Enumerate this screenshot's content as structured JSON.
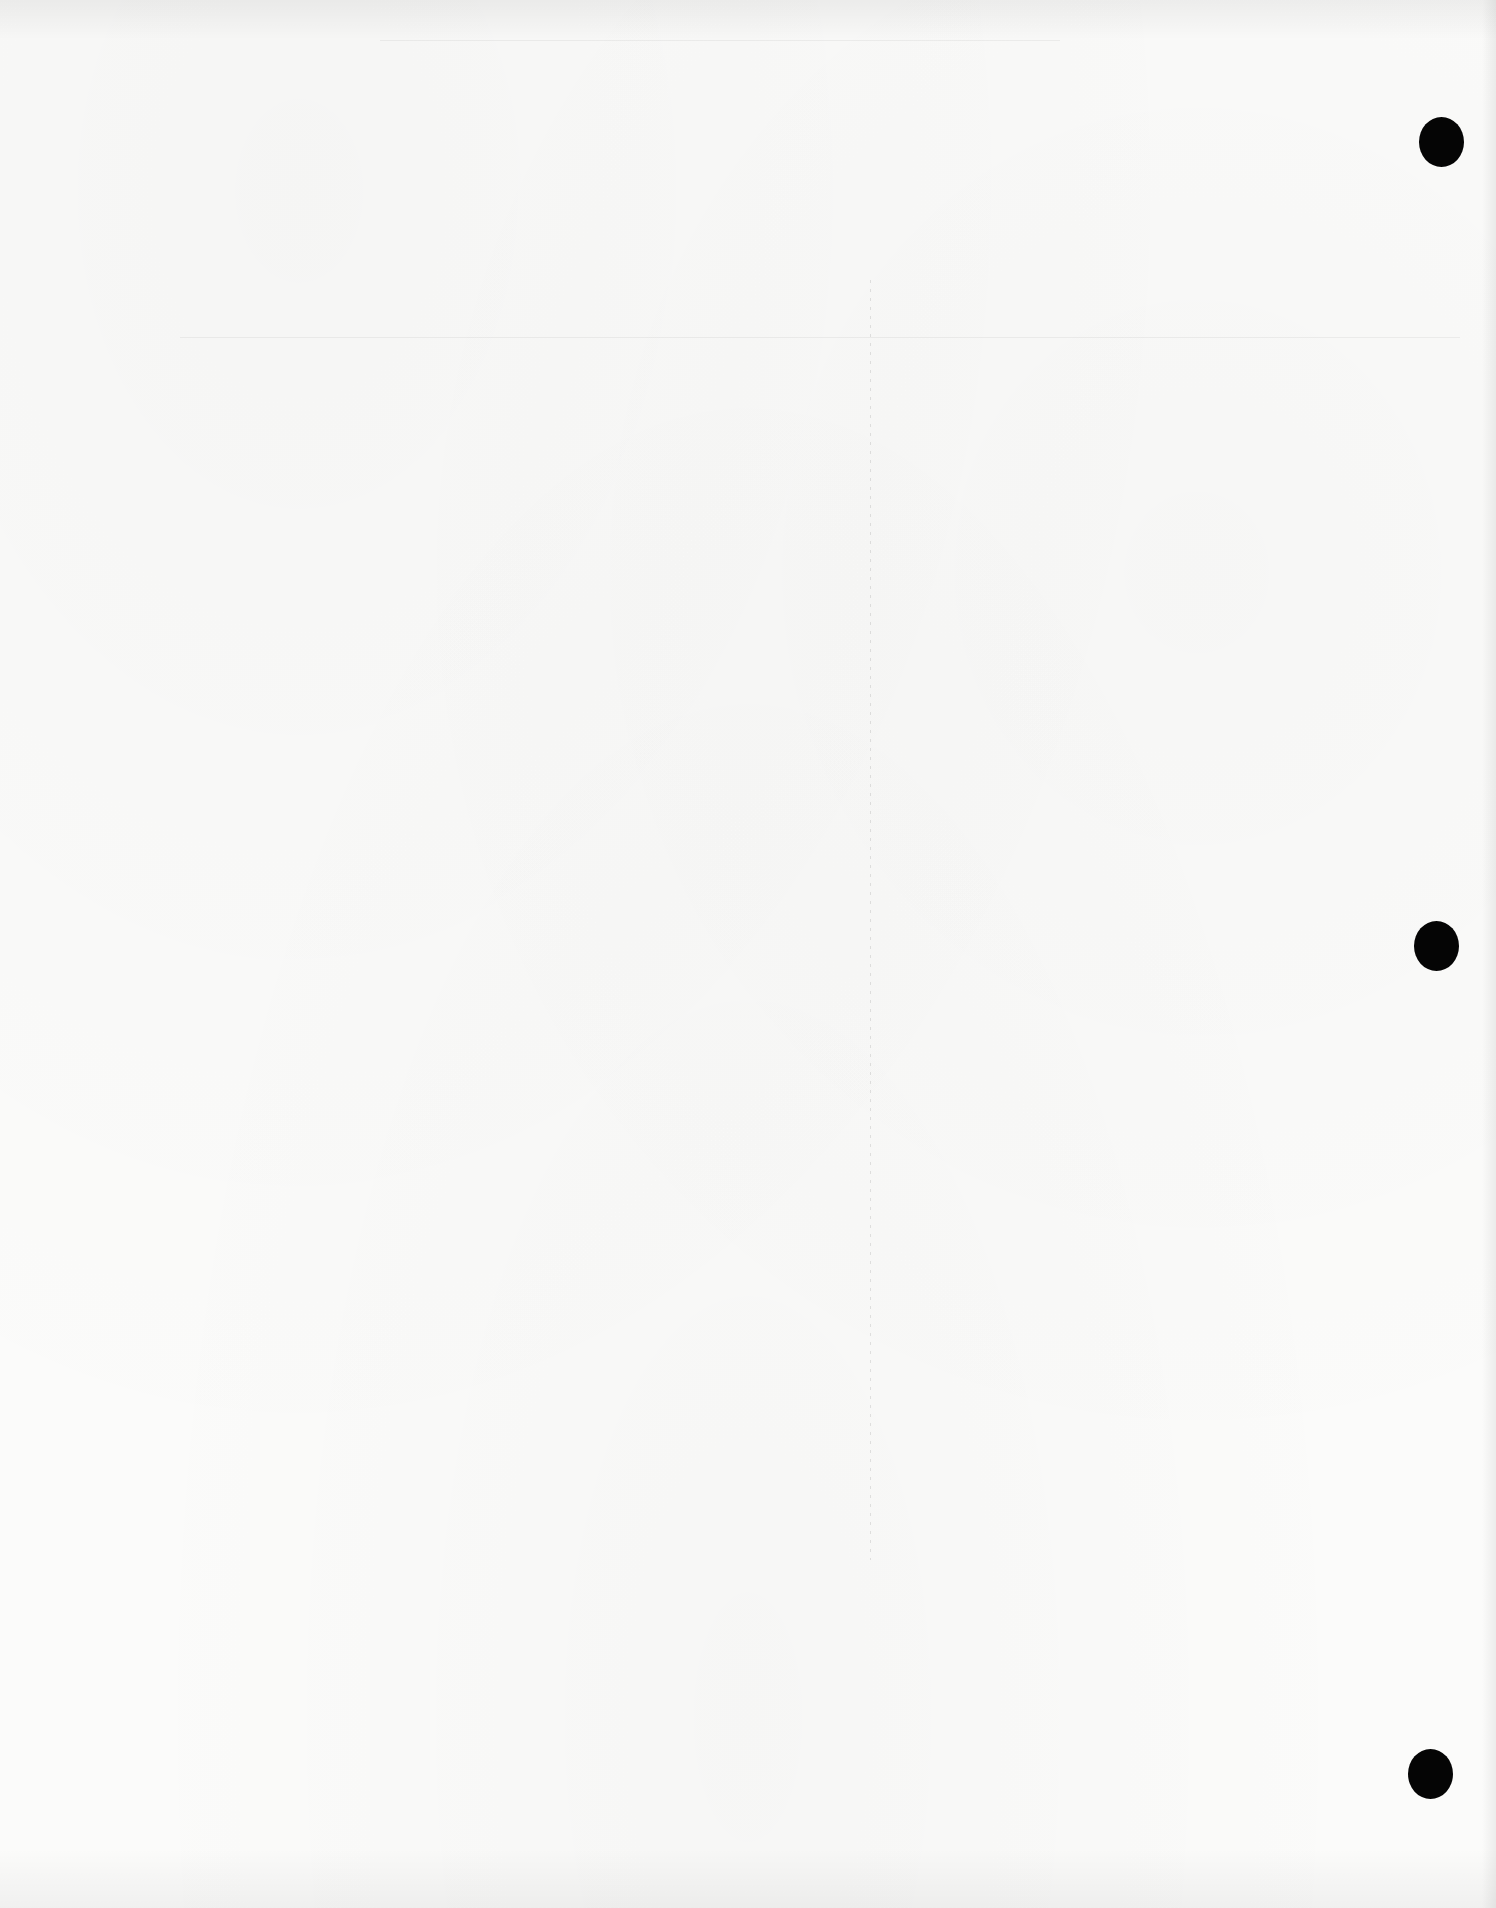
{
  "document": {
    "type": "scanned blank page",
    "text_content": "",
    "background_color": "#fbfbfa"
  },
  "punch_holes": [
    {
      "label": "top",
      "x": 1419,
      "y": 117,
      "width": 45,
      "height": 50,
      "color": "#050505"
    },
    {
      "label": "middle",
      "x": 1414,
      "y": 921,
      "width": 45,
      "height": 50,
      "color": "#050505"
    },
    {
      "label": "bottom",
      "x": 1408,
      "y": 1749,
      "width": 45,
      "height": 50,
      "color": "#050505"
    }
  ],
  "artifacts": {
    "fold_line": {
      "x": 870,
      "y_start": 280,
      "y_end": 1560
    },
    "horizontal_rules": [
      {
        "x": 180,
        "y": 337,
        "width": 1280
      },
      {
        "x": 380,
        "y": 40,
        "width": 680
      }
    ]
  }
}
